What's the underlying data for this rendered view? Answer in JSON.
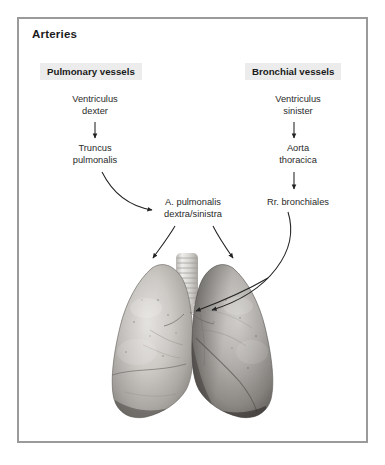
{
  "panel": {
    "title": "Arteries",
    "border_color": "#9a9a9a",
    "background_color": "#ffffff"
  },
  "columns": {
    "left": {
      "header": "Pulmonary vessels",
      "header_bg": "#ececec",
      "nodes": [
        {
          "id": "ventriculus-dexter",
          "label": "Ventriculus\ndexter"
        },
        {
          "id": "truncus-pulmonalis",
          "label": "Truncus\npulmonalis"
        }
      ]
    },
    "right": {
      "header": "Bronchial vessels",
      "header_bg": "#ececec",
      "nodes": [
        {
          "id": "ventriculus-sinister",
          "label": "Ventriculus\nsinister"
        },
        {
          "id": "aorta-thoracica",
          "label": "Aorta\nthoracica"
        },
        {
          "id": "rr-bronchiales",
          "label": "Rr. bronchiales"
        }
      ]
    },
    "center": {
      "nodes": [
        {
          "id": "a-pulmonalis",
          "label": "A. pulmonalis\ndextra/sinistra"
        }
      ]
    }
  },
  "connectors": [
    {
      "id": "vd-to-tp",
      "from": "ventriculus-dexter",
      "to": "truncus-pulmonalis",
      "style": "straight-down"
    },
    {
      "id": "tp-to-ap",
      "from": "truncus-pulmonalis",
      "to": "a-pulmonalis",
      "style": "curve-right-down"
    },
    {
      "id": "ap-to-left-lung",
      "from": "a-pulmonalis",
      "to": "left-lung",
      "style": "curve-left-down"
    },
    {
      "id": "ap-to-right-lung",
      "from": "a-pulmonalis",
      "to": "right-lung",
      "style": "curve-right-down"
    },
    {
      "id": "vs-to-at",
      "from": "ventriculus-sinister",
      "to": "aorta-thoracica",
      "style": "straight-down"
    },
    {
      "id": "at-to-rb",
      "from": "aorta-thoracica",
      "to": "rr-bronchiales",
      "style": "straight-down"
    },
    {
      "id": "rb-to-hilum",
      "from": "rr-bronchiales",
      "to": "hilum",
      "style": "long-curve-down-left"
    }
  ],
  "illustration": {
    "name": "lungs-anatomical-photograph",
    "description": "Grayscale photograph of human lungs with trachea",
    "parts": [
      "trachea",
      "left-lung",
      "right-lung",
      "hilum"
    ]
  },
  "colors": {
    "text": "#2a2a2a",
    "title": "#1b1b1b",
    "arrow": "#222222",
    "frame": "#9a9a9a"
  }
}
